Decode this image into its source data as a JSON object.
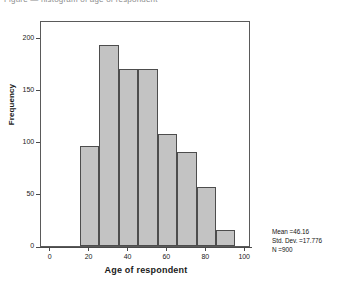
{
  "top_caption": "Figure — histogram of age of respondent",
  "chart_data": {
    "type": "bar",
    "title": "",
    "subtitle": "",
    "xlabel": "Age of respondent",
    "ylabel": "Frequency",
    "categories": [
      "15-25",
      "25-35",
      "35-45",
      "45-55",
      "55-65",
      "65-75",
      "75-85",
      "85-95"
    ],
    "bin_edges": [
      15,
      25,
      35,
      45,
      55,
      65,
      75,
      85,
      95
    ],
    "values": [
      96,
      193,
      170,
      170,
      108,
      90,
      57,
      15
    ],
    "xlim": [
      -5,
      103
    ],
    "ylim": [
      0,
      217
    ],
    "xticks": [
      0,
      20,
      40,
      60,
      80,
      100
    ],
    "yticks": [
      0,
      50,
      100,
      150,
      200
    ],
    "xtick_labels": [
      "0",
      "20",
      "40",
      "60",
      "80",
      "100"
    ],
    "ytick_labels": [
      "0",
      "50",
      "100",
      "150",
      "200"
    ],
    "grid": false,
    "legend": "none",
    "bar_fill_color": "#c3c3c3",
    "bar_edge_color": "#4d4d4d",
    "frame_color": "#5a5a5a"
  },
  "annotations": {
    "mean": "Mean =46.16",
    "std_dev": "Std. Dev. =17.776",
    "n": "N =900"
  }
}
